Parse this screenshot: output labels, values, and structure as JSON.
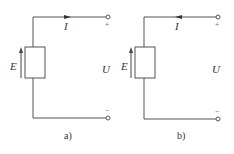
{
  "diagram": {
    "type": "circuit",
    "colors": {
      "wire": "#555555",
      "text": "#333333",
      "background": "#ffffff"
    },
    "panels": [
      {
        "caption": "a)",
        "source_label": "E",
        "current_label": "I",
        "voltage_label": "U",
        "top_terminal_sign": "+",
        "bottom_terminal_sign": "−",
        "current_direction": "right",
        "emf_direction": "up"
      },
      {
        "caption": "b)",
        "source_label": "E",
        "current_label": "I",
        "voltage_label": "U",
        "top_terminal_sign": "+",
        "bottom_terminal_sign": "−",
        "current_direction": "left",
        "emf_direction": "up"
      }
    ]
  }
}
